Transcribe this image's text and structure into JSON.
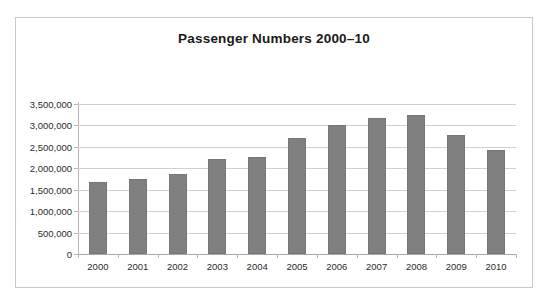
{
  "chart_data": {
    "type": "bar",
    "title": "Passenger Numbers  2000–10",
    "xlabel": "",
    "ylabel": "",
    "categories": [
      "2000",
      "2001",
      "2002",
      "2003",
      "2004",
      "2005",
      "2006",
      "2007",
      "2008",
      "2009",
      "2010"
    ],
    "values": [
      1680000,
      1760000,
      1870000,
      2220000,
      2270000,
      2700000,
      3000000,
      3170000,
      3240000,
      2780000,
      2430000
    ],
    "series": [
      {
        "name": "Passenger Numbers",
        "values": [
          1680000,
          1760000,
          1870000,
          2220000,
          2270000,
          2700000,
          3000000,
          3170000,
          3240000,
          2780000,
          2430000
        ]
      }
    ],
    "ylim": [
      0,
      3500000
    ],
    "ytick_values": [
      0,
      500000,
      1000000,
      1500000,
      2000000,
      2500000,
      3000000,
      3500000
    ],
    "ytick_labels": [
      "0",
      "500,000",
      "1,000,000",
      "1,500,000",
      "2,000,000",
      "2,500,000",
      "3,000,000",
      "3,500,000"
    ],
    "grid": true,
    "legend": false,
    "legend_position": "none",
    "bar_color": "#808080",
    "grid_color": "#d0d0d0",
    "axis_color": "#b5b5b5",
    "plot_background": "#ffffff",
    "frame_border_color": "#c9c9c9"
  }
}
